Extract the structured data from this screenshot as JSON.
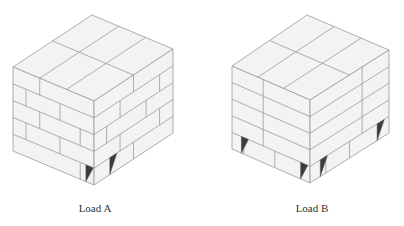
{
  "figures": [
    {
      "id": "load-a",
      "label": "Load A",
      "label_x": 35,
      "geometry": {
        "T": [
          92,
          15
        ],
        "L": [
          13,
          67
        ],
        "F": [
          94,
          101
        ],
        "R": [
          173,
          49
        ],
        "H": 84
      },
      "top_grid": {
        "along_left": [
          0.5
        ],
        "along_right": [
          0.33,
          0.66
        ]
      },
      "layers": 5,
      "pattern": "interlocked",
      "left_face_joints": [
        [
          0.33
        ],
        [
          0.58,
          0.16
        ],
        [
          0.33,
          0.83
        ],
        [
          0.58,
          0.16
        ],
        [
          0.83
        ]
      ],
      "right_face_joints": [
        [
          0.5
        ],
        [
          0.33,
          0.83
        ],
        [
          0.16,
          0.66
        ],
        [
          0.33,
          0.83
        ],
        [
          0.5
        ]
      ],
      "notches": [
        {
          "face": "left",
          "at": 0.9
        },
        {
          "face": "right",
          "at": 0.2
        }
      ]
    },
    {
      "id": "load-b",
      "label": "Load B",
      "label_x": 252,
      "geometry": {
        "T": [
          307,
          15
        ],
        "L": [
          232,
          66
        ],
        "F": [
          310,
          100
        ],
        "R": [
          389,
          50
        ],
        "H": 83
      },
      "top_grid": {
        "along_left": [
          0.5
        ],
        "along_right": [
          0.33,
          0.66
        ]
      },
      "layers": 5,
      "pattern": "column",
      "left_face_joints": [
        [
          0.4
        ],
        [
          0.4
        ],
        [
          0.4
        ],
        [
          0.4
        ],
        [
          0.15,
          0.55
        ]
      ],
      "right_face_joints": [
        [
          0.66
        ],
        [
          0.66
        ],
        [
          0.66
        ],
        [
          0.66
        ],
        [
          0.2,
          0.5,
          0.86
        ]
      ],
      "notches": [
        {
          "face": "left",
          "at": 0.12
        },
        {
          "face": "left",
          "at": 0.88
        },
        {
          "face": "right",
          "at": 0.13
        },
        {
          "face": "right",
          "at": 0.85
        }
      ]
    }
  ],
  "colors": {
    "face": "#f3f3f3",
    "stroke": "#9a9a9a",
    "notch": "#3c3c3c"
  }
}
